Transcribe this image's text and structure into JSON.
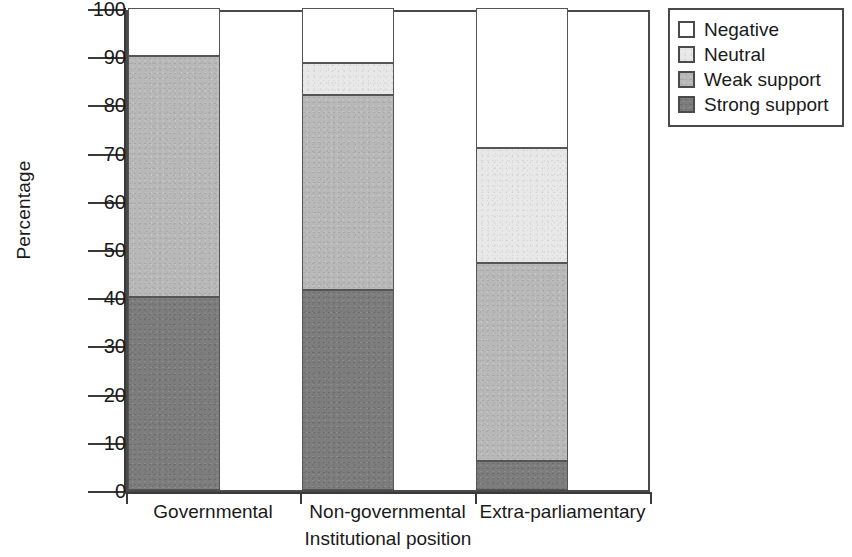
{
  "chart_data": {
    "type": "bar",
    "subtype": "stacked-bar",
    "title": "",
    "xlabel": "Institutional position",
    "ylabel": "Percentage",
    "categories": [
      "Governmental",
      "Non-governmental",
      "Extra-parliamentary"
    ],
    "series": [
      {
        "name": "Strong support",
        "color": "#7d7d7d",
        "values": [
          40,
          41.5,
          6
        ]
      },
      {
        "name": "Weak support",
        "color": "#b8b8b8",
        "values": [
          50,
          40.5,
          41
        ]
      },
      {
        "name": "Neutral",
        "color": "#e8e8e8",
        "values": [
          0,
          6.5,
          24
        ]
      },
      {
        "name": "Negative",
        "color": "#ffffff",
        "values": [
          10,
          11.5,
          29
        ]
      }
    ],
    "stack_order_bottom_to_top": [
      "Strong support",
      "Weak support",
      "Neutral",
      "Negative"
    ],
    "ylim": [
      0,
      100
    ],
    "yticks": [
      0,
      10,
      20,
      30,
      40,
      50,
      60,
      70,
      80,
      90,
      100
    ],
    "ytick_labels": [
      "0",
      "10",
      "20",
      "30",
      "40",
      "50",
      "60",
      "70",
      "80",
      "90",
      "100"
    ],
    "grid": false,
    "legend_position": "top-right",
    "legend_entries": [
      "Negative",
      "Neutral",
      "Weak support",
      "Strong support"
    ],
    "cumulative_tops": {
      "Governmental": {
        "strong": 40,
        "weak": 90,
        "neutral": 90,
        "negative": 100
      },
      "Non-governmental": {
        "strong": 41.5,
        "weak": 82,
        "neutral": 88.5,
        "negative": 100
      },
      "Extra-parliamentary": {
        "strong": 6,
        "weak": 47,
        "neutral": 71,
        "negative": 100
      }
    }
  },
  "legend": {
    "items": [
      {
        "label": "Negative",
        "swatch": "legend-swatch-negative"
      },
      {
        "label": "Neutral",
        "swatch": "legend-swatch-neutral"
      },
      {
        "label": "Weak support",
        "swatch": "legend-swatch-weak-support"
      },
      {
        "label": "Strong support",
        "swatch": "legend-swatch-strong-support"
      }
    ]
  },
  "axes": {
    "y_title": "Percentage",
    "x_title": "Institutional position",
    "y_ticks": [
      "100",
      "90",
      "80",
      "70",
      "60",
      "50",
      "40",
      "30",
      "20",
      "10",
      "0"
    ],
    "x_ticks": [
      "Governmental",
      "Non-governmental",
      "Extra-parliamentary"
    ]
  }
}
